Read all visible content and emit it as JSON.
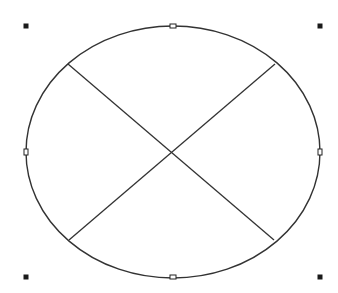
{
  "canvas": {
    "width": 338,
    "height": 293,
    "background": "#ffffff"
  },
  "shape": {
    "type": "ellipse",
    "cx": 173,
    "cy": 152,
    "rx": 147,
    "ry": 126,
    "stroke": "#333333",
    "stroke_width": 1.4,
    "fill": "none"
  },
  "cross_lines": [
    {
      "name": "diagonal-line-tl-br",
      "x1": 68,
      "y1": 64,
      "x2": 274,
      "y2": 240
    },
    {
      "name": "diagonal-line-tr-bl",
      "x1": 275,
      "y1": 64,
      "x2": 69,
      "y2": 240
    }
  ],
  "line_style": {
    "stroke": "#333333",
    "stroke_width": 1.3
  },
  "selection_handles": {
    "corner": [
      {
        "name": "handle-top-left",
        "x": 26,
        "y": 26
      },
      {
        "name": "handle-top-right",
        "x": 320,
        "y": 26
      },
      {
        "name": "handle-bottom-left",
        "x": 26,
        "y": 277
      },
      {
        "name": "handle-bottom-right",
        "x": 320,
        "y": 277
      }
    ],
    "midpoint": [
      {
        "name": "handle-top-middle",
        "x": 173,
        "y": 26,
        "orientation": "horizontal"
      },
      {
        "name": "handle-middle-left",
        "x": 26,
        "y": 152,
        "orientation": "vertical"
      },
      {
        "name": "handle-middle-right",
        "x": 320,
        "y": 152,
        "orientation": "vertical"
      },
      {
        "name": "handle-bottom-middle",
        "x": 173,
        "y": 277,
        "orientation": "horizontal"
      }
    ],
    "corner_size": 5,
    "corner_fill": "#1a1a1a",
    "mid_fill": "#ffffff",
    "mid_stroke": "#222222"
  }
}
